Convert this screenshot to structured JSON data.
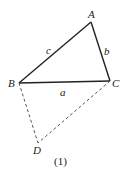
{
  "diagram": {
    "caption": "(1)",
    "points": {
      "A": {
        "label": "A",
        "x": 91,
        "y": 22
      },
      "B": {
        "label": "B",
        "x": 19,
        "y": 83
      },
      "C": {
        "label": "C",
        "x": 110,
        "y": 81
      },
      "D": {
        "label": "D",
        "x": 38,
        "y": 143
      }
    },
    "sides": {
      "a": "a",
      "b": "b",
      "c": "c"
    },
    "colors": {
      "stroke": "#222222",
      "dashed": "#555555"
    }
  }
}
